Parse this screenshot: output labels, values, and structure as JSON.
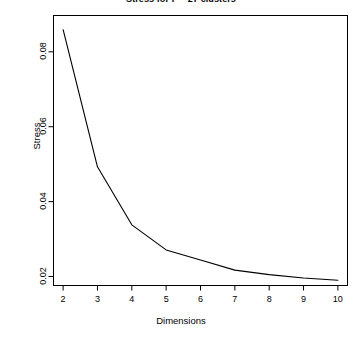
{
  "chart_data": {
    "type": "line",
    "title": "Stress for F = 27 clusters",
    "xlabel": "Dimensions",
    "ylabel": "Stress",
    "x": [
      2,
      3,
      4,
      5,
      6,
      7,
      8,
      9,
      10
    ],
    "values": [
      0.0859,
      0.0493,
      0.0338,
      0.0271,
      0.0244,
      0.0217,
      0.0205,
      0.0196,
      0.019
    ],
    "series": [
      {
        "name": "Stress",
        "values": [
          0.0859,
          0.0493,
          0.0338,
          0.0271,
          0.0244,
          0.0217,
          0.0205,
          0.0196,
          0.019
        ]
      }
    ],
    "xticks": [
      "2",
      "3",
      "4",
      "5",
      "6",
      "7",
      "8",
      "9",
      "10"
    ],
    "xtick_values": [
      2,
      3,
      4,
      5,
      6,
      7,
      8,
      9,
      10
    ],
    "yticks": [
      "0.02",
      "0.04",
      "0.06",
      "0.08"
    ],
    "ytick_values": [
      0.02,
      0.04,
      0.06,
      0.08
    ],
    "xlim": [
      1.72,
      10.28
    ],
    "ylim": [
      0.0176,
      0.0897
    ],
    "grid": false,
    "legend": false,
    "line_color": "#000000",
    "background_color": "#ffffff",
    "axis_color": "#000000"
  },
  "axes": {
    "yticklabels": [
      {
        "text": "0.02"
      },
      {
        "text": "0.04"
      },
      {
        "text": "0.06"
      },
      {
        "text": "0.08"
      }
    ],
    "xticklabels": [
      {
        "text": "2"
      },
      {
        "text": "3"
      },
      {
        "text": "4"
      },
      {
        "text": "5"
      },
      {
        "text": "6"
      },
      {
        "text": "7"
      },
      {
        "text": "8"
      },
      {
        "text": "9"
      },
      {
        "text": "10"
      }
    ]
  }
}
